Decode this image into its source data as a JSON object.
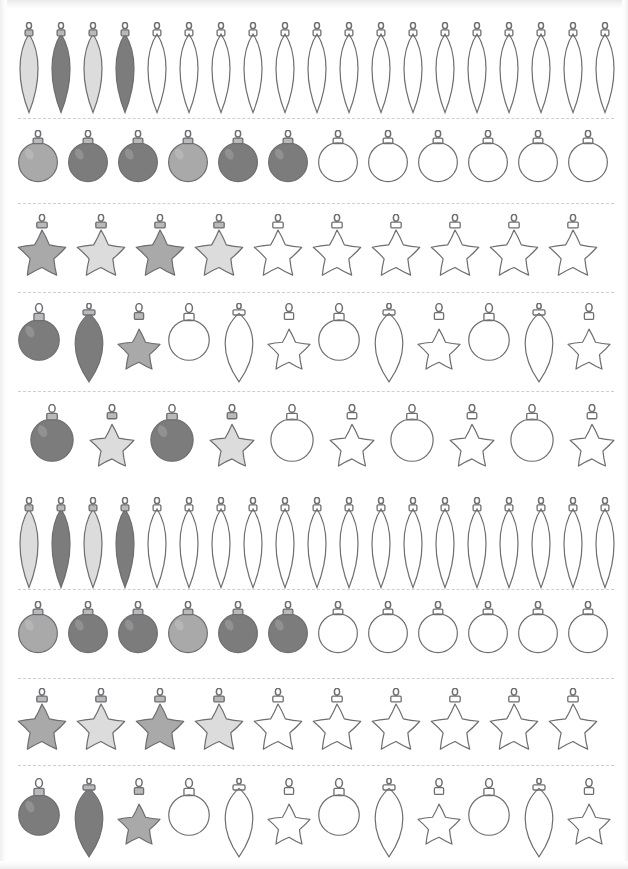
{
  "worksheet": {
    "title": "Christmas Ornament Tracing and Coloring Pattern Sheet",
    "description": "Scanned black-and-white worksheet page with nine horizontal strips of Christmas ornaments. Each strip begins with filled gray ornaments followed by blank outline ornaments to be colored in, and the strips are separated by dashed cut lines.",
    "page_width": 628,
    "page_height": 869,
    "background_color": "#ffffff",
    "outline_color": "#6e6e72",
    "dash_line_color": "#cfcfd1",
    "cap_color": "#b9b9bc",
    "shape_names": [
      "teardrop",
      "ball",
      "star"
    ],
    "fill_tones": {
      "light": "#dcdcdc",
      "medium": "#a9a9a9",
      "dark": "#7c7c7c",
      "outline": "none"
    },
    "strip_count": 9,
    "dividers": [
      {
        "name": "divider-1",
        "y": 118
      },
      {
        "name": "divider-2",
        "y": 203
      },
      {
        "name": "divider-3",
        "y": 292
      },
      {
        "name": "divider-4",
        "y": 391
      },
      {
        "name": "divider-5",
        "y": 589
      },
      {
        "name": "divider-6",
        "y": 678
      },
      {
        "name": "divider-7",
        "y": 765
      }
    ],
    "rows": [
      {
        "index": 1,
        "name": "row-teardrops-1",
        "top": 22,
        "shape_pattern": "teardrop",
        "left_pad": 14,
        "gap": 2,
        "item_width": 30,
        "item_height": 92,
        "count": 19,
        "items": [
          {
            "shape": "teardrop",
            "fill": "light"
          },
          {
            "shape": "teardrop",
            "fill": "dark"
          },
          {
            "shape": "teardrop",
            "fill": "light"
          },
          {
            "shape": "teardrop",
            "fill": "dark"
          },
          {
            "shape": "teardrop",
            "fill": "outline"
          },
          {
            "shape": "teardrop",
            "fill": "outline"
          },
          {
            "shape": "teardrop",
            "fill": "outline"
          },
          {
            "shape": "teardrop",
            "fill": "outline"
          },
          {
            "shape": "teardrop",
            "fill": "outline"
          },
          {
            "shape": "teardrop",
            "fill": "outline"
          },
          {
            "shape": "teardrop",
            "fill": "outline"
          },
          {
            "shape": "teardrop",
            "fill": "outline"
          },
          {
            "shape": "teardrop",
            "fill": "outline"
          },
          {
            "shape": "teardrop",
            "fill": "outline"
          },
          {
            "shape": "teardrop",
            "fill": "outline"
          },
          {
            "shape": "teardrop",
            "fill": "outline"
          },
          {
            "shape": "teardrop",
            "fill": "outline"
          },
          {
            "shape": "teardrop",
            "fill": "outline"
          },
          {
            "shape": "teardrop",
            "fill": "outline"
          }
        ]
      },
      {
        "index": 2,
        "name": "row-balls-1",
        "top": 130,
        "shape_pattern": "ball",
        "left_pad": 16,
        "gap": 6,
        "item_width": 44,
        "item_height": 62,
        "count": 12,
        "items": [
          {
            "shape": "ball",
            "fill": "medium"
          },
          {
            "shape": "ball",
            "fill": "dark"
          },
          {
            "shape": "ball",
            "fill": "dark"
          },
          {
            "shape": "ball",
            "fill": "medium"
          },
          {
            "shape": "ball",
            "fill": "dark"
          },
          {
            "shape": "ball",
            "fill": "dark"
          },
          {
            "shape": "ball",
            "fill": "outline"
          },
          {
            "shape": "ball",
            "fill": "outline"
          },
          {
            "shape": "ball",
            "fill": "outline"
          },
          {
            "shape": "ball",
            "fill": "outline"
          },
          {
            "shape": "ball",
            "fill": "outline"
          },
          {
            "shape": "ball",
            "fill": "outline"
          }
        ]
      },
      {
        "index": 3,
        "name": "row-stars-1",
        "top": 214,
        "shape_pattern": "star",
        "left_pad": 16,
        "gap": 7,
        "item_width": 52,
        "item_height": 68,
        "count": 10,
        "items": [
          {
            "shape": "star",
            "fill": "medium"
          },
          {
            "shape": "star",
            "fill": "light"
          },
          {
            "shape": "star",
            "fill": "medium"
          },
          {
            "shape": "star",
            "fill": "light"
          },
          {
            "shape": "star",
            "fill": "outline"
          },
          {
            "shape": "star",
            "fill": "outline"
          },
          {
            "shape": "star",
            "fill": "outline"
          },
          {
            "shape": "star",
            "fill": "outline"
          },
          {
            "shape": "star",
            "fill": "outline"
          },
          {
            "shape": "star",
            "fill": "outline"
          }
        ]
      },
      {
        "index": 4,
        "name": "row-mixed-1",
        "top": 303,
        "shape_pattern": "ball-teardrop-star",
        "left_pad": 16,
        "gap": 4,
        "item_width": 46,
        "item_height": 80,
        "count": 12,
        "items": [
          {
            "shape": "ball",
            "fill": "dark"
          },
          {
            "shape": "teardrop",
            "fill": "dark"
          },
          {
            "shape": "star",
            "fill": "medium"
          },
          {
            "shape": "ball",
            "fill": "outline"
          },
          {
            "shape": "teardrop",
            "fill": "outline"
          },
          {
            "shape": "star",
            "fill": "outline"
          },
          {
            "shape": "ball",
            "fill": "outline"
          },
          {
            "shape": "teardrop",
            "fill": "outline"
          },
          {
            "shape": "star",
            "fill": "outline"
          },
          {
            "shape": "ball",
            "fill": "outline"
          },
          {
            "shape": "teardrop",
            "fill": "outline"
          },
          {
            "shape": "star",
            "fill": "outline"
          }
        ]
      },
      {
        "index": 5,
        "name": "row-mixed-2",
        "top": 404,
        "shape_pattern": "ball-star",
        "left_pad": 28,
        "gap": 12,
        "item_width": 48,
        "item_height": 72,
        "count": 10,
        "items": [
          {
            "shape": "ball",
            "fill": "dark"
          },
          {
            "shape": "star",
            "fill": "light"
          },
          {
            "shape": "ball",
            "fill": "dark"
          },
          {
            "shape": "star",
            "fill": "light"
          },
          {
            "shape": "ball",
            "fill": "outline"
          },
          {
            "shape": "star",
            "fill": "outline"
          },
          {
            "shape": "ball",
            "fill": "outline"
          },
          {
            "shape": "star",
            "fill": "outline"
          },
          {
            "shape": "ball",
            "fill": "outline"
          },
          {
            "shape": "star",
            "fill": "outline"
          }
        ]
      },
      {
        "index": 6,
        "name": "row-teardrops-2",
        "top": 497,
        "shape_pattern": "teardrop",
        "left_pad": 14,
        "gap": 2,
        "item_width": 30,
        "item_height": 92,
        "count": 19,
        "items": [
          {
            "shape": "teardrop",
            "fill": "light"
          },
          {
            "shape": "teardrop",
            "fill": "dark"
          },
          {
            "shape": "teardrop",
            "fill": "light"
          },
          {
            "shape": "teardrop",
            "fill": "dark"
          },
          {
            "shape": "teardrop",
            "fill": "outline"
          },
          {
            "shape": "teardrop",
            "fill": "outline"
          },
          {
            "shape": "teardrop",
            "fill": "outline"
          },
          {
            "shape": "teardrop",
            "fill": "outline"
          },
          {
            "shape": "teardrop",
            "fill": "outline"
          },
          {
            "shape": "teardrop",
            "fill": "outline"
          },
          {
            "shape": "teardrop",
            "fill": "outline"
          },
          {
            "shape": "teardrop",
            "fill": "outline"
          },
          {
            "shape": "teardrop",
            "fill": "outline"
          },
          {
            "shape": "teardrop",
            "fill": "outline"
          },
          {
            "shape": "teardrop",
            "fill": "outline"
          },
          {
            "shape": "teardrop",
            "fill": "outline"
          },
          {
            "shape": "teardrop",
            "fill": "outline"
          },
          {
            "shape": "teardrop",
            "fill": "outline"
          },
          {
            "shape": "teardrop",
            "fill": "outline"
          }
        ]
      },
      {
        "index": 7,
        "name": "row-balls-2",
        "top": 601,
        "shape_pattern": "ball",
        "left_pad": 16,
        "gap": 6,
        "item_width": 44,
        "item_height": 62,
        "count": 12,
        "items": [
          {
            "shape": "ball",
            "fill": "medium"
          },
          {
            "shape": "ball",
            "fill": "dark"
          },
          {
            "shape": "ball",
            "fill": "dark"
          },
          {
            "shape": "ball",
            "fill": "medium"
          },
          {
            "shape": "ball",
            "fill": "dark"
          },
          {
            "shape": "ball",
            "fill": "dark"
          },
          {
            "shape": "ball",
            "fill": "outline"
          },
          {
            "shape": "ball",
            "fill": "outline"
          },
          {
            "shape": "ball",
            "fill": "outline"
          },
          {
            "shape": "ball",
            "fill": "outline"
          },
          {
            "shape": "ball",
            "fill": "outline"
          },
          {
            "shape": "ball",
            "fill": "outline"
          }
        ]
      },
      {
        "index": 8,
        "name": "row-stars-2",
        "top": 688,
        "shape_pattern": "star",
        "left_pad": 16,
        "gap": 7,
        "item_width": 52,
        "item_height": 68,
        "count": 10,
        "items": [
          {
            "shape": "star",
            "fill": "medium"
          },
          {
            "shape": "star",
            "fill": "light"
          },
          {
            "shape": "star",
            "fill": "medium"
          },
          {
            "shape": "star",
            "fill": "light"
          },
          {
            "shape": "star",
            "fill": "outline"
          },
          {
            "shape": "star",
            "fill": "outline"
          },
          {
            "shape": "star",
            "fill": "outline"
          },
          {
            "shape": "star",
            "fill": "outline"
          },
          {
            "shape": "star",
            "fill": "outline"
          },
          {
            "shape": "star",
            "fill": "outline"
          }
        ]
      },
      {
        "index": 9,
        "name": "row-mixed-3",
        "top": 778,
        "shape_pattern": "ball-teardrop-star",
        "left_pad": 16,
        "gap": 4,
        "item_width": 46,
        "item_height": 80,
        "count": 12,
        "items": [
          {
            "shape": "ball",
            "fill": "dark"
          },
          {
            "shape": "teardrop",
            "fill": "dark"
          },
          {
            "shape": "star",
            "fill": "medium"
          },
          {
            "shape": "ball",
            "fill": "outline"
          },
          {
            "shape": "teardrop",
            "fill": "outline"
          },
          {
            "shape": "star",
            "fill": "outline"
          },
          {
            "shape": "ball",
            "fill": "outline"
          },
          {
            "shape": "teardrop",
            "fill": "outline"
          },
          {
            "shape": "star",
            "fill": "outline"
          },
          {
            "shape": "ball",
            "fill": "outline"
          },
          {
            "shape": "teardrop",
            "fill": "outline"
          },
          {
            "shape": "star",
            "fill": "outline"
          }
        ]
      }
    ]
  }
}
